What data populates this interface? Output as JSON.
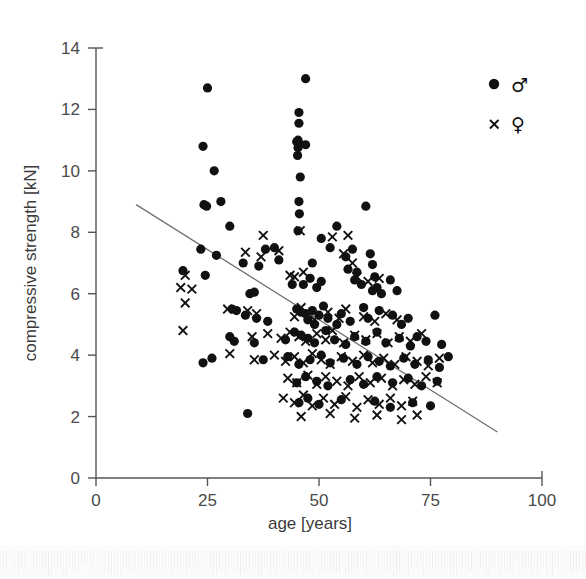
{
  "chart_data": {
    "type": "scatter",
    "title": "",
    "subtitle": "",
    "xlabel": "age [years]",
    "ylabel": "compressive strength [kN]",
    "xlim": [
      0,
      100
    ],
    "ylim": [
      0,
      14
    ],
    "xticks": [
      0,
      25,
      50,
      75,
      100
    ],
    "yticks": [
      0,
      2,
      4,
      6,
      8,
      10,
      12,
      14
    ],
    "xtick_labels": [
      "0",
      "25",
      "50",
      "75",
      "100"
    ],
    "ytick_labels": [
      "0",
      "2",
      "4",
      "6",
      "8",
      "10",
      "12",
      "14"
    ],
    "grid": false,
    "legend_position": "top-right",
    "legend": [
      {
        "key": "male",
        "marker": "filled-circle",
        "label": "♂"
      },
      {
        "key": "female",
        "marker": "cross",
        "label": "♀"
      }
    ],
    "annotations": [
      {
        "type": "regression-line",
        "x0": 9,
        "y0": 8.9,
        "x1": 90,
        "y1": 1.5,
        "color": "#6f6f6f"
      }
    ],
    "series": [
      {
        "name": "♂",
        "key": "male",
        "marker": "filled-circle",
        "color": "#111111",
        "points": [
          [
            25.0,
            12.7
          ],
          [
            47.0,
            13.0
          ],
          [
            24.0,
            10.8
          ],
          [
            45.5,
            11.9
          ],
          [
            45.5,
            11.55
          ],
          [
            45.0,
            10.95
          ],
          [
            45.5,
            10.9
          ],
          [
            47.0,
            10.85
          ],
          [
            45.3,
            10.75
          ],
          [
            45.3,
            11.0
          ],
          [
            45.2,
            10.5
          ],
          [
            26.5,
            10.0
          ],
          [
            45.8,
            9.8
          ],
          [
            24.2,
            8.9
          ],
          [
            24.8,
            8.85
          ],
          [
            28.0,
            9.0
          ],
          [
            45.5,
            9.0
          ],
          [
            60.5,
            8.85
          ],
          [
            45.6,
            8.6
          ],
          [
            30.0,
            8.2
          ],
          [
            45.3,
            8.05
          ],
          [
            54.0,
            8.2
          ],
          [
            50.5,
            7.8
          ],
          [
            52.5,
            7.5
          ],
          [
            23.5,
            7.45
          ],
          [
            27.0,
            7.25
          ],
          [
            33.0,
            7.0
          ],
          [
            48.5,
            7.0
          ],
          [
            56.0,
            7.2
          ],
          [
            36.5,
            6.9
          ],
          [
            38.0,
            7.45
          ],
          [
            41.0,
            7.1
          ],
          [
            40.0,
            7.5
          ],
          [
            57.5,
            7.45
          ],
          [
            58.5,
            6.7
          ],
          [
            61.5,
            7.3
          ],
          [
            62.0,
            6.95
          ],
          [
            62.5,
            6.55
          ],
          [
            19.5,
            6.75
          ],
          [
            24.5,
            6.6
          ],
          [
            34.5,
            6.0
          ],
          [
            35.5,
            6.05
          ],
          [
            44.0,
            6.3
          ],
          [
            46.5,
            6.3
          ],
          [
            48.0,
            6.5
          ],
          [
            49.5,
            6.2
          ],
          [
            50.5,
            6.4
          ],
          [
            56.5,
            6.8
          ],
          [
            58.0,
            6.45
          ],
          [
            59.5,
            6.3
          ],
          [
            62.0,
            6.1
          ],
          [
            63.0,
            6.2
          ],
          [
            64.0,
            6.0
          ],
          [
            66.0,
            6.45
          ],
          [
            67.5,
            6.1
          ],
          [
            30.5,
            5.5
          ],
          [
            31.5,
            5.45
          ],
          [
            33.5,
            5.3
          ],
          [
            36.0,
            5.2
          ],
          [
            38.5,
            5.1
          ],
          [
            45.0,
            5.5
          ],
          [
            46.0,
            5.4
          ],
          [
            47.0,
            5.35
          ],
          [
            47.5,
            5.15
          ],
          [
            48.5,
            5.45
          ],
          [
            49.0,
            5.0
          ],
          [
            50.0,
            5.3
          ],
          [
            51.0,
            5.6
          ],
          [
            52.0,
            5.2
          ],
          [
            54.0,
            5.0
          ],
          [
            55.0,
            5.35
          ],
          [
            57.0,
            5.1
          ],
          [
            60.0,
            5.55
          ],
          [
            61.0,
            5.2
          ],
          [
            63.5,
            5.45
          ],
          [
            66.5,
            5.3
          ],
          [
            68.5,
            5.0
          ],
          [
            70.0,
            5.2
          ],
          [
            76.0,
            5.3
          ],
          [
            30.0,
            4.6
          ],
          [
            31.0,
            4.45
          ],
          [
            35.5,
            4.4
          ],
          [
            42.5,
            4.5
          ],
          [
            44.5,
            4.75
          ],
          [
            46.0,
            4.65
          ],
          [
            47.5,
            4.55
          ],
          [
            49.0,
            4.4
          ],
          [
            51.5,
            4.8
          ],
          [
            53.5,
            4.5
          ],
          [
            56.0,
            4.35
          ],
          [
            58.0,
            4.6
          ],
          [
            60.5,
            4.45
          ],
          [
            63.0,
            4.75
          ],
          [
            65.0,
            4.4
          ],
          [
            68.0,
            4.55
          ],
          [
            70.5,
            4.3
          ],
          [
            72.0,
            4.6
          ],
          [
            74.0,
            4.45
          ],
          [
            77.5,
            4.35
          ],
          [
            24.0,
            3.75
          ],
          [
            26.0,
            3.9
          ],
          [
            37.5,
            3.85
          ],
          [
            43.0,
            3.95
          ],
          [
            45.5,
            3.7
          ],
          [
            48.0,
            3.85
          ],
          [
            50.5,
            4.0
          ],
          [
            52.5,
            3.75
          ],
          [
            55.5,
            3.9
          ],
          [
            58.5,
            3.7
          ],
          [
            61.0,
            3.95
          ],
          [
            63.5,
            3.8
          ],
          [
            66.0,
            3.65
          ],
          [
            69.0,
            3.9
          ],
          [
            71.5,
            3.7
          ],
          [
            74.5,
            3.85
          ],
          [
            77.0,
            3.6
          ],
          [
            79.0,
            3.95
          ],
          [
            45.0,
            3.1
          ],
          [
            47.0,
            3.3
          ],
          [
            49.5,
            3.15
          ],
          [
            52.0,
            3.0
          ],
          [
            57.0,
            3.2
          ],
          [
            60.0,
            3.05
          ],
          [
            63.0,
            3.3
          ],
          [
            66.5,
            3.1
          ],
          [
            70.0,
            3.25
          ],
          [
            73.0,
            3.0
          ],
          [
            76.5,
            3.15
          ],
          [
            34.0,
            2.1
          ],
          [
            45.5,
            2.45
          ],
          [
            47.5,
            2.6
          ],
          [
            50.0,
            2.4
          ],
          [
            55.0,
            2.55
          ],
          [
            62.5,
            2.5
          ],
          [
            66.0,
            2.3
          ],
          [
            71.0,
            2.45
          ],
          [
            75.0,
            2.35
          ]
        ]
      },
      {
        "name": "♀",
        "key": "female",
        "marker": "cross",
        "color": "#111111",
        "points": [
          [
            45.8,
            8.05
          ],
          [
            37.5,
            7.9
          ],
          [
            33.5,
            7.35
          ],
          [
            37.0,
            7.2
          ],
          [
            41.0,
            7.4
          ],
          [
            53.0,
            7.85
          ],
          [
            56.5,
            7.9
          ],
          [
            55.5,
            7.3
          ],
          [
            57.5,
            7.0
          ],
          [
            20.0,
            6.6
          ],
          [
            19.0,
            6.2
          ],
          [
            21.5,
            6.15
          ],
          [
            20.0,
            5.7
          ],
          [
            43.5,
            6.6
          ],
          [
            44.5,
            6.55
          ],
          [
            46.5,
            6.7
          ],
          [
            58.5,
            6.55
          ],
          [
            61.0,
            6.4
          ],
          [
            63.5,
            6.5
          ],
          [
            19.5,
            4.8
          ],
          [
            29.5,
            5.5
          ],
          [
            34.0,
            5.45
          ],
          [
            36.0,
            5.35
          ],
          [
            44.5,
            5.25
          ],
          [
            46.0,
            5.55
          ],
          [
            49.0,
            5.15
          ],
          [
            52.0,
            5.4
          ],
          [
            54.5,
            5.2
          ],
          [
            56.0,
            5.5
          ],
          [
            60.0,
            5.25
          ],
          [
            62.5,
            5.1
          ],
          [
            65.0,
            5.35
          ],
          [
            67.5,
            5.15
          ],
          [
            35.0,
            4.6
          ],
          [
            38.5,
            4.7
          ],
          [
            41.5,
            4.55
          ],
          [
            43.5,
            4.75
          ],
          [
            45.5,
            4.6
          ],
          [
            47.0,
            4.45
          ],
          [
            49.5,
            4.7
          ],
          [
            51.5,
            4.5
          ],
          [
            53.0,
            4.8
          ],
          [
            55.5,
            4.4
          ],
          [
            58.0,
            4.65
          ],
          [
            60.5,
            4.5
          ],
          [
            63.0,
            4.7
          ],
          [
            65.5,
            4.4
          ],
          [
            68.0,
            4.6
          ],
          [
            70.5,
            4.45
          ],
          [
            73.0,
            4.7
          ],
          [
            30.0,
            4.05
          ],
          [
            35.5,
            3.85
          ],
          [
            40.0,
            4.0
          ],
          [
            42.5,
            3.8
          ],
          [
            44.5,
            3.95
          ],
          [
            46.5,
            3.75
          ],
          [
            48.5,
            4.05
          ],
          [
            50.5,
            3.85
          ],
          [
            52.5,
            3.7
          ],
          [
            55.0,
            3.95
          ],
          [
            57.5,
            3.8
          ],
          [
            60.0,
            4.0
          ],
          [
            62.0,
            3.75
          ],
          [
            64.5,
            3.9
          ],
          [
            67.0,
            3.7
          ],
          [
            69.5,
            3.95
          ],
          [
            72.0,
            3.8
          ],
          [
            74.5,
            3.65
          ],
          [
            77.0,
            3.9
          ],
          [
            43.0,
            3.25
          ],
          [
            45.0,
            3.1
          ],
          [
            47.5,
            3.35
          ],
          [
            49.5,
            3.05
          ],
          [
            51.5,
            3.3
          ],
          [
            54.0,
            3.15
          ],
          [
            56.5,
            3.0
          ],
          [
            59.0,
            3.3
          ],
          [
            61.5,
            3.1
          ],
          [
            64.0,
            3.25
          ],
          [
            66.5,
            3.0
          ],
          [
            69.0,
            3.2
          ],
          [
            71.5,
            3.05
          ],
          [
            74.0,
            3.3
          ],
          [
            76.5,
            3.1
          ],
          [
            42.0,
            2.6
          ],
          [
            44.5,
            2.45
          ],
          [
            46.5,
            2.7
          ],
          [
            48.5,
            2.35
          ],
          [
            51.0,
            2.6
          ],
          [
            53.5,
            2.4
          ],
          [
            56.0,
            2.65
          ],
          [
            58.5,
            2.3
          ],
          [
            61.0,
            2.55
          ],
          [
            63.5,
            2.4
          ],
          [
            66.0,
            2.6
          ],
          [
            68.5,
            2.35
          ],
          [
            71.0,
            2.5
          ],
          [
            46.0,
            2.0
          ],
          [
            52.5,
            2.1
          ],
          [
            58.0,
            1.95
          ],
          [
            63.0,
            2.05
          ],
          [
            68.5,
            1.9
          ],
          [
            72.0,
            2.05
          ]
        ]
      }
    ]
  },
  "legend_panel": {
    "male_symbol": "♂",
    "female_symbol": "♀"
  }
}
